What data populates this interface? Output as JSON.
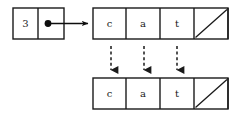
{
  "diagram": {
    "background_color": "#ffffff",
    "line_color": "#1a1a1a",
    "width": 238,
    "height": 114,
    "header": {
      "name": "string-header-node",
      "length_label": "3",
      "pointer_label": "pointer-dot",
      "box": {
        "x": 13,
        "y": 8,
        "width": 51,
        "height": 31,
        "divider_x": 38
      },
      "pointer_dot": {
        "cx": 48,
        "cy": 23.5,
        "r": 3.4
      },
      "arrow": {
        "x1": 48,
        "y1": 23.5,
        "x2": 91,
        "y2": 23.5,
        "style": "solid"
      }
    },
    "arrays": [
      {
        "name": "top-character-array",
        "x": 93,
        "y": 8,
        "cell_width": 33,
        "cell_height": 31,
        "cells": [
          {
            "label": "c",
            "type": "char"
          },
          {
            "label": "a",
            "type": "char"
          },
          {
            "label": "t",
            "type": "char"
          },
          {
            "label": "",
            "type": "empty"
          },
          {
            "label": "",
            "type": "null-slash"
          }
        ]
      },
      {
        "name": "bottom-character-array",
        "x": 93,
        "y": 78,
        "cell_width": 33,
        "cell_height": 31,
        "cells": [
          {
            "label": "c",
            "type": "char"
          },
          {
            "label": "a",
            "type": "char"
          },
          {
            "label": "t",
            "type": "char"
          },
          {
            "label": "",
            "type": "empty"
          },
          {
            "label": "",
            "type": "null-slash"
          }
        ]
      }
    ],
    "copy_arrows": [
      {
        "name": "copy-arrow-c",
        "x": 111,
        "y1": 45,
        "y2": 74,
        "style": "dashed"
      },
      {
        "name": "copy-arrow-a",
        "x": 144,
        "y1": 45,
        "y2": 74,
        "style": "dashed"
      },
      {
        "name": "copy-arrow-t",
        "x": 177,
        "y1": 45,
        "y2": 74,
        "style": "dashed"
      }
    ]
  }
}
